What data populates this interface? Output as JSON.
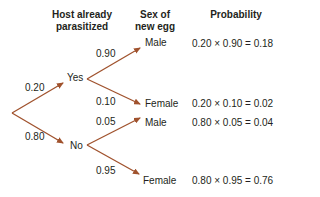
{
  "headers": {
    "host": [
      "Host already",
      "parasitized"
    ],
    "sex": [
      "Sex of",
      "new egg"
    ],
    "probability": "Probability"
  },
  "nodes": {
    "yes": "Yes",
    "no": "No",
    "male_top": "Male",
    "female_upper": "Female",
    "male_lower": "Male",
    "female_bottom": "Female"
  },
  "branch_probs": {
    "root_yes": "0.20",
    "root_no": "0.80",
    "yes_male": "0.90",
    "yes_female": "0.10",
    "no_male": "0.05",
    "no_female": "0.95"
  },
  "results": [
    "0.20 × 0.90 = 0.18",
    "0.20 × 0.10 = 0.02",
    "0.80 × 0.05 = 0.04",
    "0.80 × 0.95 = 0.76"
  ],
  "colors": {
    "arrow": "#a0522d",
    "text": "#231f20"
  }
}
